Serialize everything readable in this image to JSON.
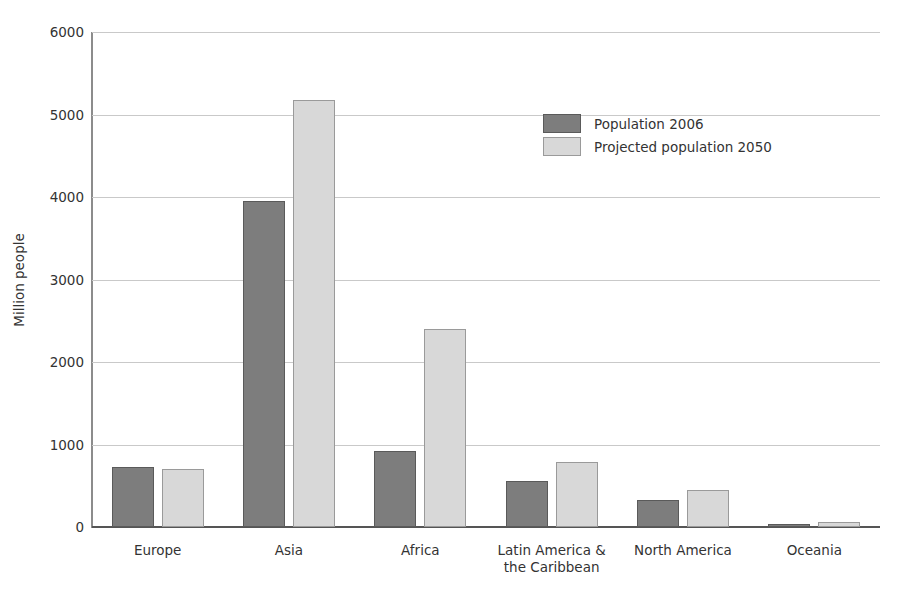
{
  "chart_data": {
    "type": "bar",
    "title": "World population in 2006 and projected for 2050",
    "xlabel": "",
    "ylabel": "Million people",
    "categories": [
      "Europe",
      "Asia",
      "Africa",
      "Latin America &\nthe Caribbean",
      "North America",
      "Oceania"
    ],
    "series": [
      {
        "name": "Population 2006",
        "color": "#7d7d7d",
        "values": [
          730,
          3950,
          920,
          560,
          330,
          33
        ]
      },
      {
        "name": "Projected population 2050",
        "color": "#d8d8d8",
        "values": [
          705,
          5170,
          2400,
          790,
          450,
          65
        ]
      }
    ],
    "ylim": [
      0,
      6000
    ],
    "yticks": [
      0,
      1000,
      2000,
      3000,
      4000,
      5000,
      6000
    ],
    "ytick_labels": [
      "0",
      "1000",
      "2000",
      "3000",
      "4000",
      "5000",
      "6000"
    ],
    "grid": "horizontal",
    "legend_position": "upper-center-right"
  },
  "legend": {
    "entries": [
      {
        "label": "Population 2006",
        "swatch": "dark-gray-swatch"
      },
      {
        "label": "Projected population 2050",
        "swatch": "light-gray-swatch"
      }
    ]
  },
  "colors": {
    "series_2006": "#7d7d7d",
    "series_2050": "#d8d8d8",
    "gridline": "#c9c9c9",
    "axis": "#555555",
    "text": "#333333",
    "background": "#ffffff"
  }
}
